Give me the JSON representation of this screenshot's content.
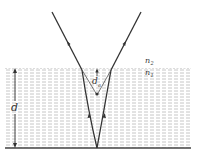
{
  "diagram": {
    "type": "refraction-apparent-depth",
    "labels": {
      "upper_medium": "n",
      "upper_medium_sub": "2",
      "lower_medium": "n",
      "lower_medium_sub": "1",
      "real_depth": "d",
      "apparent_depth": "d",
      "apparent_depth_sub": "a"
    },
    "colors": {
      "ray": "#333333",
      "medium_dash": "#b8b8b8",
      "bottom_line": "#444444"
    }
  }
}
